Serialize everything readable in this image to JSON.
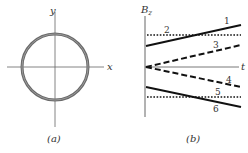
{
  "panel_a": {
    "caption": "(a)",
    "x_label": "x",
    "y_label": "y",
    "shape": "circular loop"
  },
  "panel_b": {
    "caption": "(b)",
    "y_label": "B",
    "y_label_sub": "z",
    "x_label": "t",
    "lines": [
      {
        "id": "1",
        "label": "1",
        "style": "solid",
        "trend": "increasing from positive intercept"
      },
      {
        "id": "2",
        "label": "2",
        "style": "dotted",
        "trend": "constant positive"
      },
      {
        "id": "3",
        "label": "3",
        "style": "dashed",
        "trend": "increasing from zero"
      },
      {
        "id": "4",
        "label": "4",
        "style": "dashed",
        "trend": "decreasing from zero"
      },
      {
        "id": "5",
        "label": "5",
        "style": "dotted",
        "trend": "constant negative"
      },
      {
        "id": "6",
        "label": "6",
        "style": "solid",
        "trend": "decreasing from negative intercept"
      }
    ]
  },
  "colors": {
    "axis": "#555555",
    "circle": "#666666",
    "line": "#111111"
  }
}
